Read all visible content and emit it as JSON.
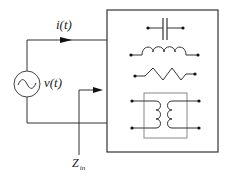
{
  "diagram": {
    "type": "circuit",
    "labels": {
      "current": "i(t)",
      "voltage": "v(t)",
      "impedance_main": "Z",
      "impedance_sub": "in"
    },
    "components": [
      {
        "name": "ac-voltage-source"
      },
      {
        "name": "capacitor"
      },
      {
        "name": "inductor"
      },
      {
        "name": "resistor"
      },
      {
        "name": "transformer"
      }
    ],
    "colors": {
      "wire": "#333333",
      "inner_box": "#888888",
      "background": "#ffffff"
    }
  }
}
